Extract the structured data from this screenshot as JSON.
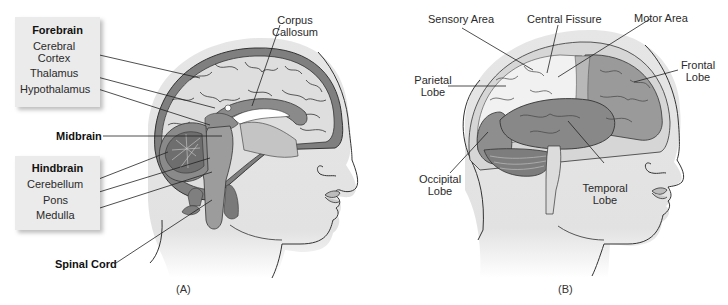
{
  "panel_a": {
    "caption": "(A)",
    "groups": {
      "forebrain": {
        "title": "Forebrain",
        "items": [
          "Cerebral\nCortex",
          "Thalamus",
          "Hypothalamus"
        ]
      },
      "hindbrain": {
        "title": "Hindbrain",
        "items": [
          "Cerebellum",
          "Pons",
          "Medulla"
        ]
      }
    },
    "labels": {
      "cerebral_cortex_1": "Cerebral",
      "cerebral_cortex_2": "Cortex",
      "thalamus": "Thalamus",
      "hypothalamus": "Hypothalamus",
      "midbrain": "Midbrain",
      "cerebellum": "Cerebellum",
      "pons": "Pons",
      "medulla": "Medulla",
      "spinal_cord": "Spinal Cord",
      "corpus_callosum_1": "Corpus",
      "corpus_callosum_2": "Callosum"
    }
  },
  "panel_b": {
    "caption": "(B)",
    "labels": {
      "sensory_area": "Sensory Area",
      "central_fissure": "Central Fissure",
      "motor_area": "Motor Area",
      "parietal_lobe_1": "Parietal",
      "parietal_lobe_2": "Lobe",
      "frontal_lobe_1": "Frontal",
      "frontal_lobe_2": "Lobe",
      "occipital_lobe_1": "Occipital",
      "occipital_lobe_2": "Lobe",
      "temporal_lobe_1": "Temporal",
      "temporal_lobe_2": "Lobe"
    }
  },
  "colors": {
    "skin": "#e8e8e8",
    "outline": "#333333",
    "brain_light": "#dcdcdc",
    "brain_mid": "#9a9a9a",
    "brain_dark": "#7c7c7c",
    "label_box": "#ebebeb"
  }
}
